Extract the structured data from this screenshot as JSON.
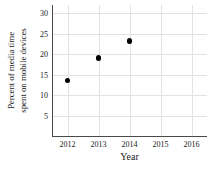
{
  "chart_data": {
    "type": "scatter",
    "title": "",
    "xlabel": "Year",
    "ylabel": "Percent of media time spent on mobile devices",
    "ylabel_lines": [
      "Percent of media time",
      "spent on mobile devices"
    ],
    "x": [
      2012,
      2013,
      2014
    ],
    "values": [
      13.5,
      19.0,
      23.2
    ],
    "points": [
      {
        "x": 2012,
        "y": 13.5
      },
      {
        "x": 2013,
        "y": 19.0
      },
      {
        "x": 2014,
        "y": 23.2
      }
    ],
    "xlim": [
      2011.5,
      2016.5
    ],
    "ylim": [
      0,
      32
    ],
    "xticks": [
      2012,
      2013,
      2014,
      2015,
      2016
    ],
    "yticks": [
      5,
      10,
      15,
      20,
      25,
      30
    ],
    "xtick_labels": [
      "2012",
      "2013",
      "2014",
      "2015",
      "2016"
    ],
    "ytick_labels": [
      "5",
      "10",
      "15",
      "20",
      "25",
      "30"
    ],
    "grid": true,
    "legend": null,
    "marker_color": "#000000",
    "grid_color": "#e2e2e2",
    "axis_color": "#4a4a4a",
    "background_color": "#ffffff"
  }
}
